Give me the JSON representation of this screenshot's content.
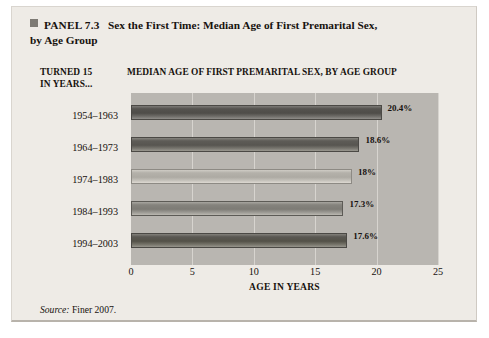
{
  "panel": {
    "marker_icon": "square-marker-icon",
    "tag": "PANEL 7.3",
    "title": "Sex the First Time: Median Age of First Premarital Sex,",
    "title_continued": "by Age Group"
  },
  "headers": {
    "left_column": "TURNED 15 IN YEARS...",
    "left_column_line1": "TURNED 15",
    "left_column_line2": "IN YEARS...",
    "chart_heading": "MEDIAN AGE OF FIRST PREMARITAL SEX, BY AGE GROUP"
  },
  "source": {
    "label": "Source:",
    "text": "Finer 2007."
  },
  "chart_data": {
    "type": "bar",
    "orientation": "horizontal",
    "title": "MEDIAN AGE OF FIRST PREMARITAL SEX, BY AGE GROUP",
    "categories": [
      "1954–1963",
      "1964–1973",
      "1974–1983",
      "1984–1993",
      "1994–2003"
    ],
    "values": [
      20.4,
      18.6,
      18,
      17.3,
      17.6
    ],
    "data_labels": [
      "20.4%",
      "18.6%",
      "18%",
      "17.3%",
      "17.6%"
    ],
    "xlabel": "AGE IN YEARS",
    "ylabel": "TURNED 15 IN YEARS...",
    "xlim": [
      0,
      25
    ],
    "xticks": [
      0,
      5,
      10,
      15,
      20,
      25
    ],
    "xtick_labels": [
      "0",
      "5",
      "10",
      "15",
      "20",
      "25"
    ],
    "grid": true,
    "legend": false,
    "plot_background": "#b9b6b1",
    "bar_colors": [
      "#55534f",
      "#5e5c57",
      "#b4b1aa",
      "#85837d",
      "#5a5853"
    ]
  }
}
